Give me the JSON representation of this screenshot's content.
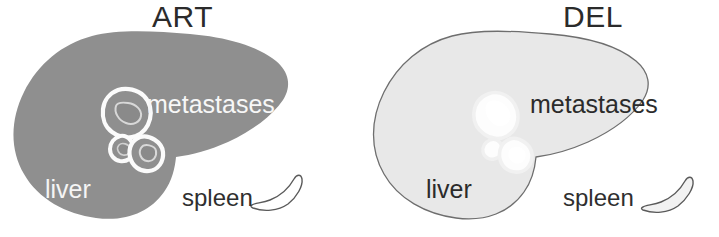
{
  "figure": {
    "type": "medical-illustration",
    "width": 719,
    "height": 237,
    "background_color": "#ffffff"
  },
  "panels": [
    {
      "id": "art",
      "title": "ART",
      "liver_fill": "#8f8f8f",
      "liver_stroke": "none",
      "lesion_stroke": "#fbfbfb",
      "lesion_fill": "#8f8f8f",
      "label_color": "#f7f7f7",
      "spleen_fill": "#ffffff",
      "spleen_stroke": "#5a5a5a",
      "labels": {
        "liver": "liver",
        "metastases": "metastases",
        "spleen": "spleen"
      },
      "lesion_count": 3
    },
    {
      "id": "del",
      "title": "DEL",
      "liver_fill": "#e8e8e8",
      "liver_stroke": "#6e6e6e",
      "lesion_stroke": "#fcfcfc",
      "lesion_fill": "#fdfdfd",
      "label_color": "#2b2b2b",
      "spleen_fill": "#f2f2f2",
      "spleen_stroke": "#5a5a5a",
      "labels": {
        "liver": "liver",
        "metastases": "metastases",
        "spleen": "spleen"
      },
      "lesion_count": 3
    }
  ]
}
